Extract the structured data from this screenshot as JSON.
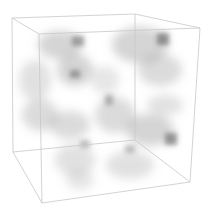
{
  "image": {
    "description": "3D volume rendering of a translucent cube with gray cloudy density",
    "background": "#ffffff",
    "edge_color": "#c8c8c8",
    "blob_color": "#555555"
  },
  "cube": {
    "vertices": {
      "back_top_left": [
        12,
        18
      ],
      "back_top_right": [
        135,
        14
      ],
      "front_top_right": [
        200,
        28
      ],
      "front_top_left": [
        39,
        34
      ],
      "front_bottom_left": [
        42,
        203
      ],
      "front_bottom_right": [
        190,
        182
      ],
      "back_bottom_left": [
        13,
        152
      ],
      "back_bottom_right": [
        135,
        140
      ]
    }
  }
}
